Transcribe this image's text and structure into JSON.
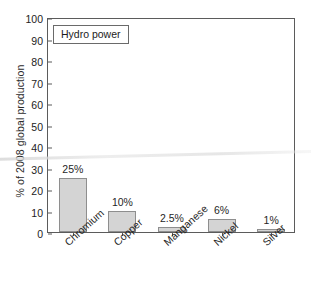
{
  "chart_data": {
    "type": "bar",
    "title": "",
    "legend_label": "Hydro power",
    "legend_position": "top-left inside plot area",
    "xlabel": "",
    "ylabel": "% of 2008 global production",
    "ylim": [
      0,
      100
    ],
    "yticks": [
      0,
      10,
      20,
      30,
      40,
      50,
      60,
      70,
      80,
      90,
      100
    ],
    "ytick_labels": [
      "0",
      "10",
      "20",
      "30",
      "40",
      "50",
      "60",
      "70",
      "80",
      "90",
      "100"
    ],
    "grid": false,
    "categories": [
      "Chromium",
      "Copper",
      "Manganese",
      "Nickel",
      "Silver"
    ],
    "values": [
      25,
      10,
      2.5,
      6,
      1
    ],
    "value_labels": [
      "25%",
      "10%",
      "2.5%",
      "6%",
      "1%"
    ],
    "bar_color": "#d4d4d4",
    "bar_edge_color": "#8e8e8e",
    "axis_color": "#5b5b5b",
    "text_color": "#1f1f1f",
    "background_color": "#ffffff"
  }
}
